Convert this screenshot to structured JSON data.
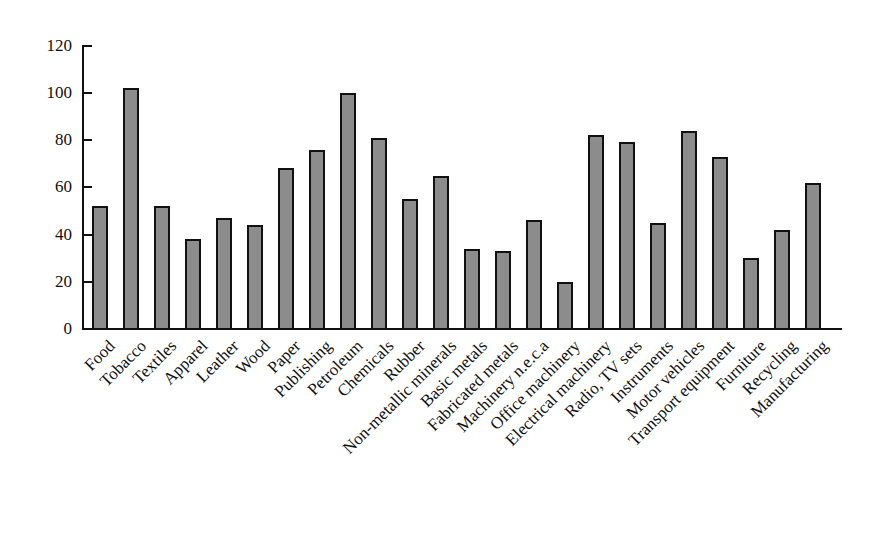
{
  "chart_data": {
    "type": "bar",
    "title": "",
    "xlabel": "",
    "ylabel": "",
    "ylim": [
      0,
      120
    ],
    "yticks": [
      0,
      20,
      40,
      60,
      80,
      100,
      120
    ],
    "grid": false,
    "legend": null,
    "categories": [
      "Food",
      "Tobacco",
      "Textiles",
      "Apparel",
      "Leather",
      "Wood",
      "Paper",
      "Publishing",
      "Petroleum",
      "Chemicals",
      "Rubber",
      "Non-metallic minerals",
      "Basic metals",
      "Fabricated metals",
      "Machinery n.e.c.a",
      "Office machinery",
      "Electrical machinery",
      "Radio, TV sets",
      "Instruments",
      "Motor vehicles",
      "Transport equipment",
      "Furniture",
      "Recycling",
      "Manufacturing"
    ],
    "values": [
      52,
      102,
      52,
      38,
      47,
      44,
      68,
      76,
      100,
      81,
      55,
      65,
      34,
      33,
      46,
      20,
      82,
      79,
      45,
      84,
      73,
      30,
      42,
      62
    ],
    "colors": {
      "bar_fill": "#8c8c8c",
      "bar_edge": "#111111"
    }
  }
}
